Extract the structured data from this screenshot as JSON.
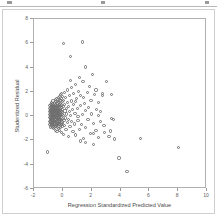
{
  "window": {
    "toolbar_visible": true
  },
  "chart_data": {
    "type": "scatter",
    "title": "",
    "xlabel": "Regression Standardized Predicted Value",
    "ylabel": "Studentized Residual",
    "xlim": [
      -2,
      10
    ],
    "ylim": [
      -6,
      8
    ],
    "xticks": [
      -2,
      0,
      2,
      4,
      6,
      8,
      10
    ],
    "yticks": [
      -6,
      -4,
      -2,
      0,
      2,
      4,
      6,
      8
    ],
    "xticklabels": [
      "-2",
      "0",
      "2",
      "4",
      "6",
      "8",
      "10"
    ],
    "yticklabels": [
      "-6",
      "-4",
      "-2",
      "0",
      "2",
      "4",
      "6",
      "8"
    ],
    "grid": false,
    "legend": null,
    "marker": "open-circle",
    "marker_color": "#6f6f6f",
    "series": [
      {
        "name": "Residuals",
        "points": [
          [
            -0.95,
            0.35
          ],
          [
            -0.93,
            -0.1
          ],
          [
            -0.92,
            0.62
          ],
          [
            -0.91,
            -0.45
          ],
          [
            -0.9,
            0.15
          ],
          [
            -0.9,
            -0.72
          ],
          [
            -0.89,
            0.88
          ],
          [
            -0.88,
            0.05
          ],
          [
            -0.88,
            -0.3
          ],
          [
            -0.87,
            0.45
          ],
          [
            -0.86,
            -0.6
          ],
          [
            -0.86,
            0.22
          ],
          [
            -0.85,
            0.72
          ],
          [
            -0.85,
            -0.15
          ],
          [
            -0.84,
            -0.9
          ],
          [
            -0.84,
            0.38
          ],
          [
            -0.83,
            0.02
          ],
          [
            -0.83,
            -0.48
          ],
          [
            -0.82,
            0.55
          ],
          [
            -0.82,
            0.95
          ],
          [
            -0.81,
            -0.25
          ],
          [
            -0.81,
            0.18
          ],
          [
            -0.8,
            -0.68
          ],
          [
            -0.8,
            0.42
          ],
          [
            -0.8,
            1.15
          ],
          [
            -0.79,
            -0.05
          ],
          [
            -0.79,
            0.68
          ],
          [
            -0.78,
            -0.38
          ],
          [
            -0.78,
            0.28
          ],
          [
            -0.77,
            -0.82
          ],
          [
            -0.77,
            0.08
          ],
          [
            -0.76,
            0.5
          ],
          [
            -0.76,
            -0.18
          ],
          [
            -0.75,
            0.85
          ],
          [
            -0.75,
            -0.55
          ],
          [
            -0.74,
            0.32
          ],
          [
            -0.74,
            -0.02
          ],
          [
            -0.73,
            0.6
          ],
          [
            -0.73,
            -0.72
          ],
          [
            -0.72,
            0.12
          ],
          [
            -0.72,
            1.02
          ],
          [
            -0.71,
            -0.32
          ],
          [
            -0.71,
            0.45
          ],
          [
            -0.7,
            -0.95
          ],
          [
            -0.7,
            0.22
          ],
          [
            -0.7,
            0.75
          ],
          [
            -0.69,
            -0.12
          ],
          [
            -0.69,
            -0.62
          ],
          [
            -0.68,
            0.38
          ],
          [
            -0.68,
            1.25
          ],
          [
            -0.67,
            -0.42
          ],
          [
            -0.67,
            0.05
          ],
          [
            -0.66,
            0.65
          ],
          [
            -0.66,
            -0.85
          ],
          [
            -0.65,
            0.3
          ],
          [
            -0.65,
            -0.22
          ],
          [
            -0.64,
            0.92
          ],
          [
            -0.64,
            -0.52
          ],
          [
            -0.63,
            0.15
          ],
          [
            -0.63,
            0.55
          ],
          [
            -0.62,
            -0.08
          ],
          [
            -0.62,
            -1.05
          ],
          [
            -0.61,
            0.48
          ],
          [
            -0.61,
            0.8
          ],
          [
            -0.6,
            -0.35
          ],
          [
            -0.6,
            0.2
          ],
          [
            -0.6,
            -0.75
          ],
          [
            -0.59,
            1.08
          ],
          [
            -0.59,
            0.0
          ],
          [
            -0.58,
            0.6
          ],
          [
            -0.58,
            -0.45
          ],
          [
            -0.57,
            0.35
          ],
          [
            -0.57,
            -0.95
          ],
          [
            -0.56,
            0.88
          ],
          [
            -0.56,
            -0.15
          ],
          [
            -0.55,
            0.25
          ],
          [
            -0.55,
            -0.65
          ],
          [
            -0.54,
            0.7
          ],
          [
            -0.54,
            0.05
          ],
          [
            -0.53,
            -0.3
          ],
          [
            -0.53,
            1.35
          ],
          [
            -0.52,
            0.42
          ],
          [
            -0.52,
            -0.85
          ],
          [
            -0.51,
            -0.05
          ],
          [
            -0.51,
            0.95
          ],
          [
            -0.5,
            -0.5
          ],
          [
            -0.5,
            0.52
          ],
          [
            -0.5,
            0.18
          ],
          [
            -0.49,
            -1.15
          ],
          [
            -0.49,
            0.75
          ],
          [
            -0.48,
            -0.25
          ],
          [
            -0.48,
            0.3
          ],
          [
            -0.47,
            1.18
          ],
          [
            -0.47,
            -0.68
          ],
          [
            -0.46,
            0.08
          ],
          [
            -0.46,
            0.62
          ],
          [
            -0.45,
            -0.38
          ],
          [
            -0.45,
            0.85
          ],
          [
            -0.44,
            -0.08
          ],
          [
            -0.44,
            0.4
          ],
          [
            -0.43,
            -0.78
          ],
          [
            -0.43,
            1.45
          ],
          [
            -0.42,
            0.22
          ],
          [
            -0.42,
            -0.55
          ],
          [
            -0.41,
            0.68
          ],
          [
            -0.41,
            0.02
          ],
          [
            -0.4,
            -1.25
          ],
          [
            -0.4,
            0.5
          ],
          [
            -0.39,
            -0.2
          ],
          [
            -0.39,
            1.0
          ],
          [
            -0.38,
            0.32
          ],
          [
            -0.38,
            -0.72
          ],
          [
            -0.37,
            0.78
          ],
          [
            -0.37,
            -0.42
          ],
          [
            -0.36,
            0.12
          ],
          [
            -0.36,
            1.22
          ],
          [
            -0.35,
            -0.92
          ],
          [
            -0.35,
            0.58
          ],
          [
            -0.34,
            -0.12
          ],
          [
            -0.34,
            0.38
          ],
          [
            -0.33,
            -0.62
          ],
          [
            -0.33,
            0.9
          ],
          [
            -0.32,
            0.18
          ],
          [
            -0.32,
            -0.35
          ],
          [
            -0.31,
            1.55
          ],
          [
            -0.31,
            0.65
          ],
          [
            -0.3,
            -1.05
          ],
          [
            -0.3,
            0.28
          ],
          [
            -0.3,
            -0.18
          ],
          [
            -0.29,
            0.82
          ],
          [
            -0.29,
            0.45
          ],
          [
            -0.28,
            -0.55
          ],
          [
            -0.28,
            1.1
          ],
          [
            -0.27,
            0.05
          ],
          [
            -0.27,
            -0.85
          ],
          [
            -0.26,
            0.55
          ],
          [
            -0.26,
            -0.3
          ],
          [
            -0.25,
            1.38
          ],
          [
            -0.25,
            0.25
          ],
          [
            -0.24,
            -0.65
          ],
          [
            -0.24,
            0.72
          ],
          [
            -0.23,
            -0.05
          ],
          [
            -0.23,
            1.62
          ],
          [
            -0.22,
            0.42
          ],
          [
            -0.22,
            -1.15
          ],
          [
            -0.21,
            0.95
          ],
          [
            -0.21,
            -0.45
          ],
          [
            -0.2,
            0.15
          ],
          [
            -0.2,
            1.28
          ],
          [
            -0.19,
            -0.75
          ],
          [
            -0.19,
            0.62
          ],
          [
            -0.18,
            0.32
          ],
          [
            -0.18,
            -0.25
          ],
          [
            -0.17,
            1.75
          ],
          [
            -0.17,
            0.85
          ],
          [
            -0.16,
            -0.58
          ],
          [
            -0.16,
            0.08
          ],
          [
            -0.15,
            1.05
          ],
          [
            -0.15,
            -0.95
          ],
          [
            -0.14,
            0.48
          ],
          [
            -0.13,
            -0.35
          ],
          [
            -0.12,
            1.48
          ],
          [
            -0.12,
            0.22
          ],
          [
            -0.11,
            -0.7
          ],
          [
            -0.1,
            0.68
          ],
          [
            -0.1,
            -0.12
          ],
          [
            -0.09,
            1.85
          ],
          [
            -0.08,
            0.38
          ],
          [
            -0.08,
            -1.32
          ],
          [
            -0.07,
            0.92
          ],
          [
            -0.06,
            -0.48
          ],
          [
            -0.05,
            0.15
          ],
          [
            -0.05,
            1.18
          ],
          [
            -0.04,
            -0.88
          ],
          [
            -0.03,
            0.55
          ],
          [
            -0.02,
            -0.22
          ],
          [
            -0.01,
            1.62
          ],
          [
            0.0,
            0.28
          ],
          [
            0.0,
            -0.62
          ],
          [
            0.02,
            0.78
          ],
          [
            0.03,
            -1.48
          ],
          [
            0.05,
            1.32
          ],
          [
            0.06,
            0.05
          ],
          [
            0.08,
            -0.38
          ],
          [
            0.1,
            0.95
          ],
          [
            0.12,
            1.95
          ],
          [
            0.13,
            -0.78
          ],
          [
            0.15,
            0.42
          ],
          [
            0.18,
            -0.15
          ],
          [
            0.2,
            1.52
          ],
          [
            0.22,
            -1.08
          ],
          [
            0.25,
            0.65
          ],
          [
            0.28,
            0.18
          ],
          [
            0.3,
            -0.52
          ],
          [
            0.32,
            2.15
          ],
          [
            0.35,
            1.15
          ],
          [
            0.38,
            -0.28
          ],
          [
            0.4,
            0.82
          ],
          [
            0.42,
            -1.65
          ],
          [
            0.45,
            0.35
          ],
          [
            0.48,
            1.72
          ],
          [
            0.5,
            -0.85
          ],
          [
            0.55,
            0.08
          ],
          [
            0.58,
            2.38
          ],
          [
            0.6,
            -0.42
          ],
          [
            0.62,
            1.25
          ],
          [
            0.65,
            0.52
          ],
          [
            0.7,
            -1.25
          ],
          [
            0.72,
            0.95
          ],
          [
            0.75,
            1.88
          ],
          [
            0.8,
            -0.65
          ],
          [
            0.85,
            0.25
          ],
          [
            0.88,
            2.62
          ],
          [
            0.9,
            -1.55
          ],
          [
            0.95,
            1.42
          ],
          [
            1.0,
            0.62
          ],
          [
            1.05,
            -0.35
          ],
          [
            1.1,
            2.05
          ],
          [
            1.15,
            -1.12
          ],
          [
            1.2,
            0.88
          ],
          [
            1.25,
            1.68
          ],
          [
            1.3,
            -0.72
          ],
          [
            1.35,
            0.15
          ],
          [
            1.4,
            2.85
          ],
          [
            1.45,
            -1.85
          ],
          [
            1.5,
            1.05
          ],
          [
            1.55,
            0.45
          ],
          [
            1.6,
            -0.95
          ],
          [
            1.7,
            1.95
          ],
          [
            1.75,
            -0.25
          ],
          [
            1.8,
            0.72
          ],
          [
            1.9,
            -1.42
          ],
          [
            1.95,
            1.32
          ],
          [
            2.0,
            0.18
          ],
          [
            2.1,
            -0.62
          ],
          [
            2.2,
            1.75
          ],
          [
            2.3,
            -1.15
          ],
          [
            2.35,
            0.58
          ],
          [
            2.45,
            -1.78
          ],
          [
            2.5,
            1.15
          ],
          [
            2.6,
            -0.45
          ],
          [
            2.75,
            1.72
          ],
          [
            2.9,
            -1.32
          ],
          [
            3.05,
            2.82
          ],
          [
            3.2,
            -1.65
          ],
          [
            3.35,
            1.78
          ],
          [
            3.5,
            -0.25
          ],
          [
            3.6,
            -1.88
          ],
          [
            3.9,
            -3.45
          ],
          [
            4.45,
            -4.55
          ],
          [
            5.4,
            -1.85
          ],
          [
            8.0,
            -2.6
          ],
          [
            0.05,
            5.95
          ],
          [
            1.35,
            6.1
          ],
          [
            0.55,
            4.9
          ],
          [
            1.55,
            4.05
          ],
          [
            2.05,
            3.45
          ],
          [
            1.15,
            3.15
          ],
          [
            0.55,
            2.95
          ],
          [
            -1.05,
            -2.95
          ],
          [
            2.1,
            -2.35
          ],
          [
            1.6,
            -2.15
          ],
          [
            1.2,
            -2.05
          ],
          [
            2.45,
            0.02
          ],
          [
            3.4,
            -0.2
          ],
          [
            2.85,
            -0.75
          ],
          [
            2.3,
            2.15
          ],
          [
            2.75,
            1.85
          ],
          [
            1.85,
            2.45
          ],
          [
            0.9,
            1.22
          ],
          [
            1.05,
            -0.05
          ],
          [
            2.15,
            -1.45
          ],
          [
            1.45,
            1.52
          ],
          [
            2.6,
            0.35
          ],
          [
            3.3,
            -1.22
          ]
        ]
      }
    ]
  }
}
